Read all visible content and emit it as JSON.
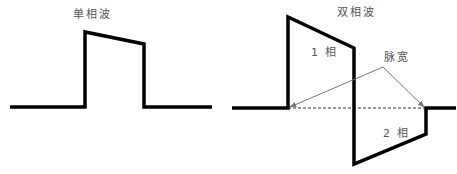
{
  "diagram": {
    "left": {
      "title": "单相波",
      "waveform": [
        [
          10,
          107
        ],
        [
          85,
          107
        ],
        [
          85,
          32
        ],
        [
          144,
          44
        ],
        [
          144,
          107
        ],
        [
          212,
          107
        ]
      ]
    },
    "right": {
      "title": "双相波",
      "phase1_label": "1 相",
      "phase2_label": "2 相",
      "pulse_width_label": "脉宽",
      "waveform": [
        [
          232,
          108
        ],
        [
          288,
          108
        ],
        [
          288,
          17
        ],
        [
          354,
          48
        ],
        [
          354,
          164
        ],
        [
          426,
          134
        ],
        [
          426,
          108
        ],
        [
          456,
          108
        ]
      ],
      "dashed_line": [
        [
          288,
          108
        ],
        [
          426,
          108
        ]
      ],
      "arrows": [
        {
          "from": [
            383,
            67
          ],
          "to": [
            290,
            107
          ]
        },
        {
          "from": [
            383,
            67
          ],
          "to": [
            424,
            107
          ]
        }
      ]
    },
    "colors": {
      "waveform": "#000000",
      "arrow": "#777777",
      "text": "#555555"
    }
  }
}
